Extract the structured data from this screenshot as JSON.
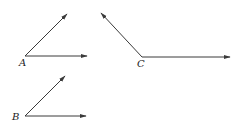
{
  "diagram": {
    "stroke_color": "#3a3a3a",
    "angles": [
      {
        "label": "A",
        "vertex": [
          25,
          56
        ],
        "ray1_end": [
          67,
          14
        ],
        "ray2_end": [
          87,
          56
        ],
        "label_pos": [
          19,
          66
        ]
      },
      {
        "label": "C",
        "vertex": [
          142,
          57
        ],
        "ray1_end": [
          101,
          13
        ],
        "ray2_end": [
          230,
          57
        ],
        "label_pos": [
          137,
          67
        ]
      },
      {
        "label": "B",
        "vertex": [
          25,
          116
        ],
        "ray1_end": [
          65,
          76
        ],
        "ray2_end": [
          86,
          116
        ],
        "label_pos": [
          12,
          120
        ]
      }
    ]
  }
}
